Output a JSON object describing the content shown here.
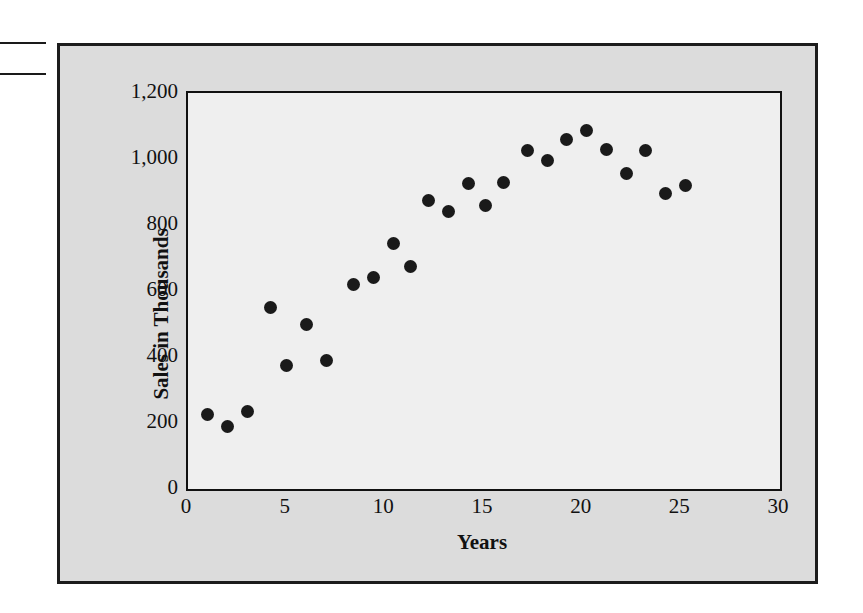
{
  "figure": {
    "background_color": "#dcdcdc",
    "plot_background_color": "#efefef",
    "border_color": "#1c1c1c",
    "point_color": "#1a1a1a"
  },
  "margin_marks": [
    {
      "name": "margin-rule-1"
    },
    {
      "name": "margin-rule-2"
    }
  ],
  "chart_data": {
    "type": "scatter",
    "title": "",
    "xlabel": "Years",
    "ylabel": "Sales in Thousands",
    "xlim": [
      0,
      30
    ],
    "ylim": [
      0,
      1200
    ],
    "xticks": [
      "0",
      "5",
      "10",
      "15",
      "20",
      "25",
      "30"
    ],
    "xtick_values": [
      0,
      5,
      10,
      15,
      20,
      25,
      30
    ],
    "yticks": [
      "0",
      "200",
      "400",
      "600",
      "800",
      "1,000",
      "1,200"
    ],
    "ytick_values": [
      0,
      200,
      400,
      600,
      800,
      1000,
      1200
    ],
    "grid": false,
    "legend": null,
    "marker": "filled-circle",
    "x": [
      1,
      2,
      3,
      4.2,
      5,
      6,
      7,
      8.4,
      9.4,
      10.4,
      11.3,
      12.2,
      13.2,
      14.2,
      15.1,
      16,
      17.2,
      18.2,
      19.2,
      20.2,
      21.2,
      22.2,
      23.2,
      24.2,
      25.2
    ],
    "y": [
      225,
      190,
      235,
      550,
      375,
      500,
      390,
      620,
      640,
      745,
      675,
      875,
      840,
      925,
      860,
      930,
      1025,
      995,
      1060,
      1085,
      1030,
      955,
      1025,
      895,
      920
    ],
    "points": [
      {
        "x": 1,
        "y": 225
      },
      {
        "x": 2,
        "y": 190
      },
      {
        "x": 3,
        "y": 235
      },
      {
        "x": 4.2,
        "y": 550
      },
      {
        "x": 5,
        "y": 375
      },
      {
        "x": 6,
        "y": 500
      },
      {
        "x": 7,
        "y": 390
      },
      {
        "x": 8.4,
        "y": 620
      },
      {
        "x": 9.4,
        "y": 640
      },
      {
        "x": 10.4,
        "y": 745
      },
      {
        "x": 11.3,
        "y": 675
      },
      {
        "x": 12.2,
        "y": 875
      },
      {
        "x": 13.2,
        "y": 840
      },
      {
        "x": 14.2,
        "y": 925
      },
      {
        "x": 15.1,
        "y": 860
      },
      {
        "x": 16,
        "y": 930
      },
      {
        "x": 17.2,
        "y": 1025
      },
      {
        "x": 18.2,
        "y": 995
      },
      {
        "x": 19.2,
        "y": 1060
      },
      {
        "x": 20.2,
        "y": 1085
      },
      {
        "x": 21.2,
        "y": 1030
      },
      {
        "x": 22.2,
        "y": 955
      },
      {
        "x": 23.2,
        "y": 1025
      },
      {
        "x": 24.2,
        "y": 895
      },
      {
        "x": 25.2,
        "y": 920
      }
    ]
  }
}
